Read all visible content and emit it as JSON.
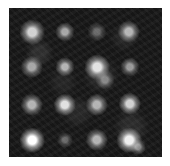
{
  "image": {
    "description": "Grayscale fluorescence microscopy image showing a 4x4 grid of bright spots on a dark noisy background",
    "background_color": "#161616",
    "spots": [
      {
        "x": 23,
        "y": 24,
        "size": 16,
        "intensity": 0.85
      },
      {
        "x": 56,
        "y": 24,
        "size": 12,
        "intensity": 0.7
      },
      {
        "x": 88,
        "y": 24,
        "size": 12,
        "intensity": 0.45
      },
      {
        "x": 120,
        "y": 24,
        "size": 14,
        "intensity": 0.75
      },
      {
        "x": 23,
        "y": 59,
        "size": 14,
        "intensity": 0.7
      },
      {
        "x": 56,
        "y": 59,
        "size": 12,
        "intensity": 0.75
      },
      {
        "x": 88,
        "y": 59,
        "size": 16,
        "intensity": 0.9
      },
      {
        "x": 121,
        "y": 59,
        "size": 12,
        "intensity": 0.65
      },
      {
        "x": 96,
        "y": 72,
        "size": 12,
        "intensity": 0.55
      },
      {
        "x": 23,
        "y": 97,
        "size": 14,
        "intensity": 0.75
      },
      {
        "x": 56,
        "y": 97,
        "size": 14,
        "intensity": 0.9
      },
      {
        "x": 88,
        "y": 97,
        "size": 14,
        "intensity": 0.75
      },
      {
        "x": 121,
        "y": 96,
        "size": 14,
        "intensity": 0.85
      },
      {
        "x": 23,
        "y": 132,
        "size": 16,
        "intensity": 1.0
      },
      {
        "x": 56,
        "y": 132,
        "size": 10,
        "intensity": 0.45
      },
      {
        "x": 88,
        "y": 132,
        "size": 14,
        "intensity": 0.75
      },
      {
        "x": 120,
        "y": 132,
        "size": 16,
        "intensity": 0.95
      },
      {
        "x": 129,
        "y": 139,
        "size": 10,
        "intensity": 0.6
      }
    ]
  }
}
